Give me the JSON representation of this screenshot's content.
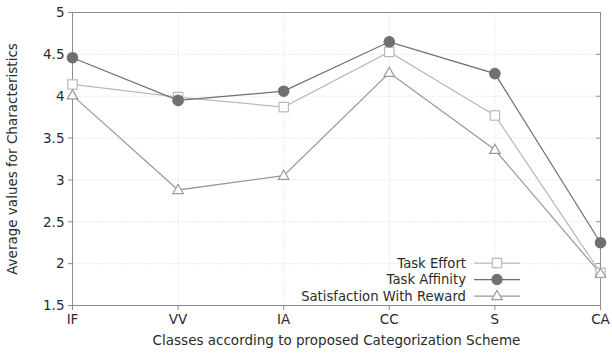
{
  "chart_data": {
    "type": "line",
    "title": "",
    "xlabel": "Classes according to proposed Categorization Scheme",
    "ylabel": "Average values for Characteristics",
    "categories": [
      "IF",
      "VV",
      "IA",
      "CC",
      "S",
      "CA"
    ],
    "ylim": [
      1.5,
      5
    ],
    "yticks": [
      "1.5",
      "2",
      "2.5",
      "3",
      "3.5",
      "4",
      "4.5",
      "5"
    ],
    "ytick_values": [
      1.5,
      2,
      2.5,
      3,
      3.5,
      4,
      4.5,
      5
    ],
    "grid": true,
    "legend_position": "lower right",
    "series": [
      {
        "name": "Task Effort",
        "marker": "open-square",
        "color": "#b9b9b9",
        "values": [
          4.14,
          3.99,
          3.87,
          4.53,
          3.77,
          1.89
        ]
      },
      {
        "name": "Task Affinity",
        "marker": "filled-circle",
        "color": "#707070",
        "values": [
          4.46,
          3.95,
          4.06,
          4.65,
          4.27,
          2.25
        ]
      },
      {
        "name": "Satisfaction With Reward",
        "marker": "open-triangle",
        "color": "#9a9a9a",
        "values": [
          4.01,
          2.88,
          3.05,
          4.28,
          3.36,
          1.88
        ]
      }
    ]
  },
  "colors": {
    "frame": "#8d8d8d",
    "grid": "#d8d8d8",
    "text": "#2b2b2b",
    "background": "#ffffff"
  },
  "legend": {
    "items": [
      {
        "label": "Task Effort"
      },
      {
        "label": "Task Affinity"
      },
      {
        "label": "Satisfaction With Reward"
      }
    ]
  }
}
